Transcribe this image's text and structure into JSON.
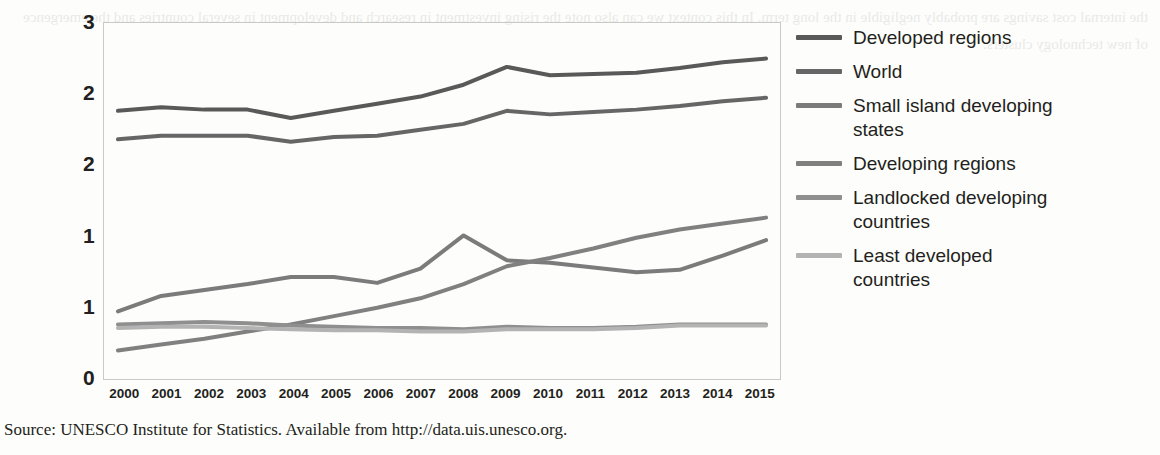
{
  "figure": {
    "source_note": "Source: UNESCO Institute for Statistics. Available from http://data.uis.unesco.org."
  },
  "legend": {
    "position": "right",
    "items": [
      {
        "label": "Developed regions",
        "label_line2": "",
        "color": "#595959"
      },
      {
        "label": "World",
        "label_line2": "",
        "color": "#666666"
      },
      {
        "label": "Small island developing",
        "label_line2": "states",
        "color": "#7b7b7b"
      },
      {
        "label": "Developing regions",
        "label_line2": "",
        "color": "#808080"
      },
      {
        "label": "Landlocked developing",
        "label_line2": " countries",
        "color": "#8f8f8f"
      },
      {
        "label": "Least developed",
        "label_line2": "countries",
        "color": "#b3b3b3"
      }
    ]
  },
  "axes": {
    "y_ticks": [
      "3",
      "2",
      "2",
      "1",
      "1",
      "0"
    ],
    "y_tick_values": [
      3.0,
      2.4,
      1.8,
      1.2,
      0.6,
      0.0
    ],
    "ylim": [
      0,
      3
    ],
    "x_ticks": [
      "2000",
      "2001",
      "2002",
      "2003",
      "2004",
      "2005",
      "2006",
      "2007",
      "2008",
      "2009",
      "2010",
      "2011",
      "2012",
      "2013",
      "2014",
      "2015"
    ]
  },
  "chart_data": {
    "type": "line",
    "title": "",
    "subtitle": "",
    "xlabel": "",
    "ylabel": "",
    "x": [
      2000,
      2001,
      2002,
      2003,
      2004,
      2005,
      2006,
      2007,
      2008,
      2009,
      2010,
      2011,
      2012,
      2013,
      2014,
      2015
    ],
    "ylim": [
      0,
      3
    ],
    "grid": false,
    "legend_position": "right",
    "series": [
      {
        "name": "Developed regions",
        "color": "#595959",
        "values": [
          2.26,
          2.29,
          2.27,
          2.27,
          2.2,
          2.26,
          2.32,
          2.38,
          2.48,
          2.63,
          2.56,
          2.57,
          2.58,
          2.62,
          2.67,
          2.7
        ]
      },
      {
        "name": "World",
        "color": "#666666",
        "values": [
          2.02,
          2.05,
          2.05,
          2.05,
          2.0,
          2.04,
          2.05,
          2.1,
          2.15,
          2.26,
          2.23,
          2.25,
          2.27,
          2.3,
          2.34,
          2.37
        ]
      },
      {
        "name": "Small island developing states",
        "color": "#7b7b7b",
        "values": [
          0.57,
          0.7,
          0.75,
          0.8,
          0.86,
          0.86,
          0.81,
          0.93,
          1.21,
          1.0,
          0.98,
          0.94,
          0.9,
          0.92,
          1.04,
          1.17
        ]
      },
      {
        "name": "Developing regions",
        "color": "#808080",
        "values": [
          0.24,
          0.29,
          0.34,
          0.4,
          0.46,
          0.53,
          0.6,
          0.68,
          0.8,
          0.95,
          1.02,
          1.1,
          1.19,
          1.26,
          1.31,
          1.36
        ]
      },
      {
        "name": "Landlocked developing countries",
        "color": "#8f8f8f",
        "values": [
          0.46,
          0.47,
          0.48,
          0.47,
          0.45,
          0.44,
          0.43,
          0.43,
          0.42,
          0.44,
          0.43,
          0.43,
          0.44,
          0.46,
          0.46,
          0.46
        ]
      },
      {
        "name": "Least developed countries",
        "color": "#b3b3b3",
        "values": [
          0.43,
          0.44,
          0.44,
          0.43,
          0.42,
          0.41,
          0.41,
          0.4,
          0.4,
          0.42,
          0.42,
          0.42,
          0.43,
          0.45,
          0.45,
          0.45
        ]
      }
    ]
  },
  "bleed_text": "the internal cost savings are probably negligible in the long term. In this context we can also note the rising investment in research and development in several countries and the emergence of new technology clusters."
}
